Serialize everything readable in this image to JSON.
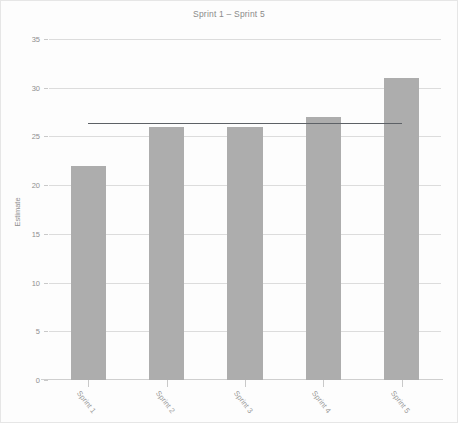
{
  "chart_data": {
    "type": "bar",
    "title": "Sprint 1 – Sprint 5",
    "xlabel": "",
    "ylabel": "Estimate",
    "categories": [
      "Sprint 1",
      "Sprint 2",
      "Sprint 3",
      "Sprint 4",
      "Sprint 5"
    ],
    "values": [
      22,
      26,
      26,
      27,
      31
    ],
    "ylim": [
      0,
      35
    ],
    "ytick_values": [
      0,
      5,
      10,
      15,
      20,
      25,
      30,
      35
    ],
    "ytick_labels": [
      "0",
      "5",
      "10",
      "15",
      "20",
      "25",
      "30",
      "35"
    ],
    "grid": true,
    "legend": false,
    "legend_position": "none",
    "bar_color": "#adadad",
    "gridline_color": "#dcdcdc",
    "background_color": "#fdfdfd",
    "border_color": "#e6e6e6",
    "annotations": [
      {
        "name": "average-reference-line",
        "type": "horizontal-line",
        "value": 26.4,
        "x_start_category": "Sprint 1",
        "x_end_category": "Sprint 5",
        "color": "#5d6166"
      }
    ]
  }
}
